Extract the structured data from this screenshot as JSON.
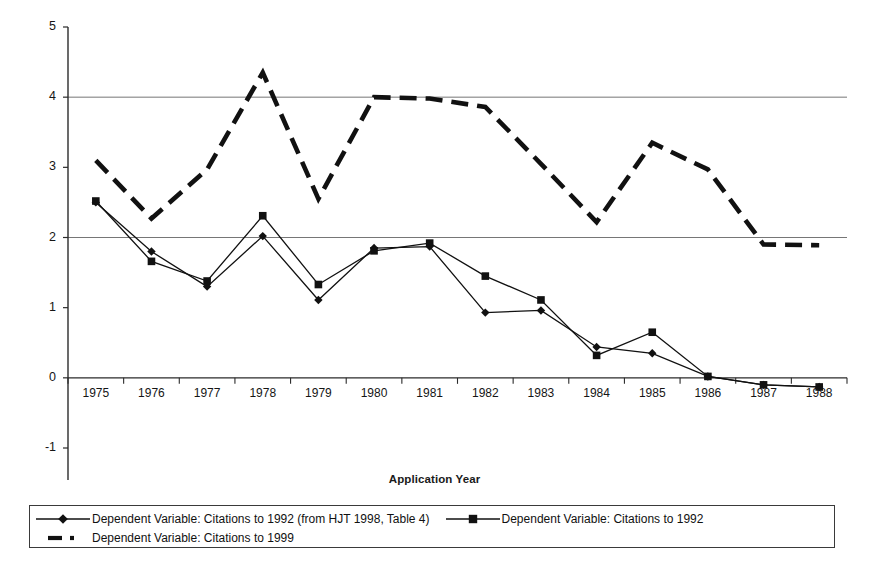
{
  "chart_data": {
    "type": "line",
    "title": "",
    "xlabel": "Application Year",
    "ylabel": "Coefficient on Interaction Term",
    "categories": [
      "1975",
      "1976",
      "1977",
      "1978",
      "1979",
      "1980",
      "1981",
      "1982",
      "1983",
      "1984",
      "1985",
      "1986",
      "1987",
      "1988"
    ],
    "ylim": [
      -1,
      5
    ],
    "yticks": [
      "-1",
      "0",
      "1",
      "2",
      "3",
      "4",
      "5"
    ],
    "gridlines": [
      2,
      4
    ],
    "grid": true,
    "legend_position": "bottom",
    "series": [
      {
        "name": "Dependent Variable: Citations to 1992 (from HJT 1998, Table 4)",
        "marker": "diamond",
        "style": "solid",
        "values": [
          2.5,
          1.8,
          1.3,
          2.02,
          1.11,
          1.85,
          1.87,
          0.93,
          0.96,
          0.44,
          0.35,
          0.02,
          -0.1,
          -0.13
        ]
      },
      {
        "name": "Dependent Variable: Citations to 1992",
        "marker": "square",
        "style": "solid",
        "values": [
          2.52,
          1.66,
          1.38,
          2.31,
          1.33,
          1.81,
          1.92,
          1.45,
          1.11,
          0.32,
          0.65,
          0.02,
          -0.1,
          -0.13
        ]
      },
      {
        "name": "Dependent Variable: Citations to 1999",
        "marker": "none",
        "style": "dashed",
        "values": [
          3.1,
          2.27,
          2.97,
          4.35,
          2.55,
          4.0,
          3.98,
          3.86,
          3.05,
          2.22,
          3.35,
          2.97,
          1.9,
          1.89
        ]
      }
    ]
  },
  "legend": {
    "entries": [
      {
        "label": "Dependent Variable: Citations to 1992 (from HJT 1998, Table 4)",
        "key": "line-diamond-key"
      },
      {
        "label": "Dependent Variable: Citations to 1992",
        "key": "line-square-key"
      },
      {
        "label": "Dependent Variable: Citations to 1999",
        "key": "line-dashed-key"
      }
    ]
  },
  "colors": {
    "series": "#111111",
    "axis": "#2b2b2b",
    "grid": "#666666",
    "background": "#ffffff"
  }
}
